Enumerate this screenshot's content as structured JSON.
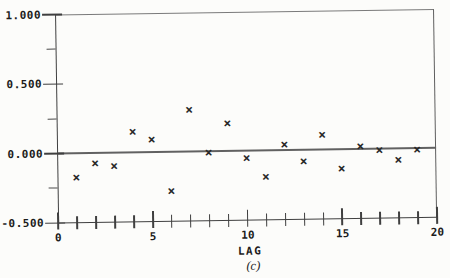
{
  "figure": {
    "background": "#fcfcfa",
    "axis_color": "#3f3f3f",
    "box_color": "#7a7a7a",
    "marker_color": "#282828",
    "text_color": "#1c1c1c"
  },
  "chart_data": {
    "type": "scatter",
    "title": "",
    "xlabel": "LAG",
    "caption": "(c)",
    "marker": "×",
    "x": [
      1,
      2,
      3,
      4,
      5,
      6,
      7,
      8,
      9,
      10,
      11,
      12,
      13,
      14,
      15,
      16,
      17,
      18,
      19
    ],
    "y": [
      -0.17,
      -0.07,
      -0.09,
      0.15,
      0.09,
      -0.28,
      0.3,
      -0.01,
      0.2,
      -0.05,
      -0.19,
      0.04,
      -0.08,
      0.11,
      -0.14,
      0.02,
      -0.01,
      -0.08,
      -0.01
    ],
    "xlim": [
      0,
      20
    ],
    "ylim": [
      -0.5,
      1.0
    ],
    "x_tick_step": 1,
    "x_major_ticks": [
      0,
      5,
      10,
      15,
      20
    ],
    "x_tick_labels": [
      "0",
      "5",
      "10",
      "15",
      "20"
    ],
    "y_major_ticks": [
      1.0,
      0.5,
      0.0,
      -0.5
    ],
    "y_tick_labels": [
      "1.000",
      "0.500",
      "0.000",
      "-0.500"
    ],
    "y_minor_ticks": [
      0.75,
      0.25,
      -0.25
    ],
    "zero_line_y": 0.0,
    "grid": false,
    "legend": false
  }
}
